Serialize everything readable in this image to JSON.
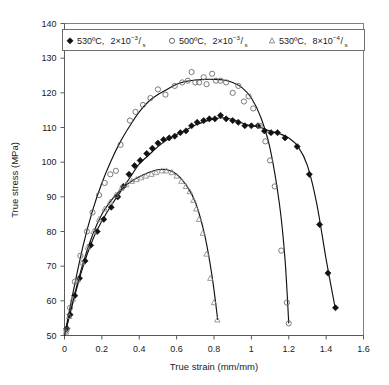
{
  "chart_data": {
    "type": "scatter",
    "title": "",
    "xlabel": "True strain (mm/mm)",
    "ylabel": "True stress (MPa)",
    "xlim": [
      0,
      1.6
    ],
    "ylim": [
      50,
      140
    ],
    "xticks": [
      "0",
      "0.2",
      "0.4",
      "0.6",
      "0.8",
      "1",
      "1.2",
      "1.4",
      "1.6"
    ],
    "xtick_values": [
      0,
      0.2,
      0.4,
      0.6,
      0.8,
      1.0,
      1.2,
      1.4,
      1.6
    ],
    "yticks": [
      "50",
      "60",
      "70",
      "80",
      "90",
      "100",
      "110",
      "120",
      "130",
      "140"
    ],
    "ytick_values": [
      50,
      60,
      70,
      80,
      90,
      100,
      110,
      120,
      130,
      140
    ],
    "grid": false,
    "legend_position": "top-inside",
    "series": [
      {
        "name": "530ºC, 2×10−3/s",
        "marker": "filled-diamond",
        "color": "#111111",
        "points": [
          [
            0.012,
            52.0
          ],
          [
            0.03,
            56.0
          ],
          [
            0.055,
            61.5
          ],
          [
            0.08,
            66.5
          ],
          [
            0.11,
            71.5
          ],
          [
            0.14,
            76.0
          ],
          [
            0.175,
            80.0
          ],
          [
            0.21,
            83.5
          ],
          [
            0.25,
            87.0
          ],
          [
            0.285,
            90.0
          ],
          [
            0.315,
            93.0
          ],
          [
            0.345,
            96.5
          ],
          [
            0.375,
            99.0
          ],
          [
            0.405,
            100.5
          ],
          [
            0.44,
            102.5
          ],
          [
            0.47,
            104.0
          ],
          [
            0.5,
            105.5
          ],
          [
            0.53,
            106.5
          ],
          [
            0.56,
            107.0
          ],
          [
            0.59,
            107.5
          ],
          [
            0.62,
            108.5
          ],
          [
            0.65,
            109.0
          ],
          [
            0.68,
            110.5
          ],
          [
            0.71,
            111.5
          ],
          [
            0.745,
            112.0
          ],
          [
            0.775,
            112.5
          ],
          [
            0.805,
            112.5
          ],
          [
            0.835,
            113.5
          ],
          [
            0.865,
            112.5
          ],
          [
            0.9,
            112.0
          ],
          [
            0.93,
            111.5
          ],
          [
            0.965,
            110.5
          ],
          [
            1.0,
            110.5
          ],
          [
            1.035,
            110.5
          ],
          [
            1.07,
            109.0
          ],
          [
            1.105,
            108.5
          ],
          [
            1.14,
            108.5
          ],
          [
            1.18,
            107.0
          ],
          [
            1.245,
            104.5
          ],
          [
            1.31,
            96.5
          ],
          [
            1.365,
            82.0
          ],
          [
            1.41,
            68.0
          ],
          [
            1.45,
            58.0
          ]
        ]
      },
      {
        "name": "500ºC, 2×10−3/s",
        "marker": "open-circle",
        "color": "#6b6b6b",
        "points": [
          [
            0.01,
            51.5
          ],
          [
            0.03,
            58.0
          ],
          [
            0.055,
            65.5
          ],
          [
            0.085,
            73.0
          ],
          [
            0.12,
            80.0
          ],
          [
            0.15,
            85.5
          ],
          [
            0.185,
            90.5
          ],
          [
            0.215,
            94.0
          ],
          [
            0.245,
            96.5
          ],
          [
            0.275,
            97.5
          ],
          [
            0.3,
            105.0
          ],
          [
            0.35,
            112.0
          ],
          [
            0.38,
            114.5
          ],
          [
            0.42,
            116.5
          ],
          [
            0.46,
            118.5
          ],
          [
            0.5,
            121.0
          ],
          [
            0.54,
            119.5
          ],
          [
            0.59,
            122.0
          ],
          [
            0.63,
            123.0
          ],
          [
            0.66,
            123.5
          ],
          [
            0.68,
            126.0
          ],
          [
            0.7,
            123.0
          ],
          [
            0.72,
            123.0
          ],
          [
            0.745,
            124.5
          ],
          [
            0.76,
            122.5
          ],
          [
            0.79,
            125.5
          ],
          [
            0.81,
            123.5
          ],
          [
            0.835,
            123.5
          ],
          [
            0.865,
            123.0
          ],
          [
            0.9,
            120.0
          ],
          [
            0.93,
            122.0
          ],
          [
            0.96,
            117.5
          ],
          [
            0.985,
            119.0
          ],
          [
            1.01,
            115.5
          ],
          [
            1.045,
            110.5
          ],
          [
            1.075,
            106.0
          ],
          [
            1.1,
            100.5
          ],
          [
            1.125,
            93.0
          ],
          [
            1.16,
            74.5
          ],
          [
            1.19,
            59.5
          ],
          [
            1.2,
            53.5
          ]
        ]
      },
      {
        "name": "530ºC, 8×10−4/s",
        "marker": "open-triangle",
        "color": "#8a8a8a",
        "points": [
          [
            0.008,
            51.0
          ],
          [
            0.025,
            55.5
          ],
          [
            0.045,
            60.5
          ],
          [
            0.07,
            66.0
          ],
          [
            0.095,
            71.0
          ],
          [
            0.125,
            75.5
          ],
          [
            0.155,
            80.0
          ],
          [
            0.185,
            83.5
          ],
          [
            0.215,
            86.5
          ],
          [
            0.245,
            88.5
          ],
          [
            0.275,
            90.5
          ],
          [
            0.305,
            92.5
          ],
          [
            0.33,
            93.5
          ],
          [
            0.36,
            94.5
          ],
          [
            0.385,
            95.0
          ],
          [
            0.41,
            95.5
          ],
          [
            0.435,
            96.0
          ],
          [
            0.465,
            96.5
          ],
          [
            0.49,
            97.0
          ],
          [
            0.52,
            97.5
          ],
          [
            0.545,
            97.5
          ],
          [
            0.575,
            97.0
          ],
          [
            0.6,
            96.0
          ],
          [
            0.625,
            94.5
          ],
          [
            0.65,
            93.0
          ],
          [
            0.67,
            91.5
          ],
          [
            0.69,
            89.0
          ],
          [
            0.705,
            86.5
          ],
          [
            0.72,
            83.5
          ],
          [
            0.74,
            79.5
          ],
          [
            0.76,
            73.5
          ],
          [
            0.78,
            66.5
          ],
          [
            0.8,
            59.5
          ],
          [
            0.818,
            54.5
          ]
        ]
      }
    ],
    "fit_curves": [
      {
        "series": "530ºC, 2×10−3/s",
        "points": [
          [
            0.0,
            50.0
          ],
          [
            0.05,
            60.5
          ],
          [
            0.1,
            70.0
          ],
          [
            0.15,
            77.5
          ],
          [
            0.2,
            83.0
          ],
          [
            0.25,
            87.5
          ],
          [
            0.3,
            91.5
          ],
          [
            0.35,
            95.5
          ],
          [
            0.4,
            99.5
          ],
          [
            0.45,
            102.0
          ],
          [
            0.5,
            104.5
          ],
          [
            0.55,
            106.5
          ],
          [
            0.6,
            108.0
          ],
          [
            0.65,
            109.3
          ],
          [
            0.7,
            110.7
          ],
          [
            0.75,
            111.7
          ],
          [
            0.8,
            112.5
          ],
          [
            0.85,
            112.8
          ],
          [
            0.9,
            112.3
          ],
          [
            0.95,
            111.3
          ],
          [
            1.0,
            110.5
          ],
          [
            1.05,
            110.0
          ],
          [
            1.1,
            109.0
          ],
          [
            1.15,
            108.2
          ],
          [
            1.2,
            107.0
          ],
          [
            1.25,
            104.5
          ],
          [
            1.3,
            99.0
          ],
          [
            1.35,
            88.0
          ],
          [
            1.4,
            72.0
          ],
          [
            1.45,
            57.5
          ]
        ]
      },
      {
        "series": "500ºC, 2×10−3/s",
        "points": [
          [
            0.0,
            50.0
          ],
          [
            0.05,
            63.5
          ],
          [
            0.1,
            76.0
          ],
          [
            0.15,
            86.0
          ],
          [
            0.2,
            94.0
          ],
          [
            0.25,
            100.5
          ],
          [
            0.3,
            106.0
          ],
          [
            0.35,
            110.5
          ],
          [
            0.4,
            114.5
          ],
          [
            0.45,
            117.5
          ],
          [
            0.5,
            119.5
          ],
          [
            0.55,
            121.0
          ],
          [
            0.6,
            122.5
          ],
          [
            0.65,
            123.3
          ],
          [
            0.7,
            123.7
          ],
          [
            0.75,
            123.9
          ],
          [
            0.8,
            123.9
          ],
          [
            0.85,
            123.7
          ],
          [
            0.9,
            123.0
          ],
          [
            0.95,
            121.5
          ],
          [
            1.0,
            118.5
          ],
          [
            1.05,
            113.0
          ],
          [
            1.1,
            104.0
          ],
          [
            1.15,
            88.0
          ],
          [
            1.18,
            72.0
          ],
          [
            1.2,
            53.5
          ]
        ]
      },
      {
        "series": "530ºC, 8×10−4/s",
        "points": [
          [
            0.0,
            50.0
          ],
          [
            0.05,
            61.0
          ],
          [
            0.1,
            71.0
          ],
          [
            0.15,
            79.0
          ],
          [
            0.2,
            85.0
          ],
          [
            0.25,
            89.0
          ],
          [
            0.3,
            92.0
          ],
          [
            0.35,
            94.2
          ],
          [
            0.4,
            95.8
          ],
          [
            0.45,
            97.0
          ],
          [
            0.5,
            97.8
          ],
          [
            0.55,
            97.8
          ],
          [
            0.6,
            96.5
          ],
          [
            0.65,
            93.5
          ],
          [
            0.7,
            88.5
          ],
          [
            0.75,
            79.0
          ],
          [
            0.79,
            67.0
          ],
          [
            0.82,
            54.5
          ]
        ]
      }
    ],
    "legend": [
      {
        "marker": "filled-diamond",
        "temperature": "530ºC,",
        "coefficient": "2×10",
        "exponent": "−3",
        "per": "/",
        "unit": "s"
      },
      {
        "marker": "open-circle",
        "temperature": "500ºC,",
        "coefficient": "2×10",
        "exponent": "−3",
        "per": "/",
        "unit": "s"
      },
      {
        "marker": "open-triangle",
        "temperature": "530ºC,",
        "coefficient": "8×10",
        "exponent": "−4",
        "per": "/",
        "unit": "s"
      }
    ]
  }
}
